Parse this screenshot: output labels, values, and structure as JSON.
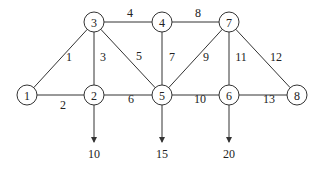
{
  "diagram": {
    "type": "network-graph",
    "nodes": [
      {
        "id": "1",
        "label": "1",
        "x": 27,
        "y": 95
      },
      {
        "id": "2",
        "label": "2",
        "x": 94,
        "y": 95
      },
      {
        "id": "3",
        "label": "3",
        "x": 94,
        "y": 22
      },
      {
        "id": "4",
        "label": "4",
        "x": 162,
        "y": 22
      },
      {
        "id": "5",
        "label": "5",
        "x": 162,
        "y": 95
      },
      {
        "id": "6",
        "label": "6",
        "x": 229,
        "y": 95
      },
      {
        "id": "7",
        "label": "7",
        "x": 229,
        "y": 22
      },
      {
        "id": "8",
        "label": "8",
        "x": 297,
        "y": 95
      }
    ],
    "edges": [
      {
        "from": "1",
        "to": "3",
        "label": "1",
        "lx": 69,
        "ly": 57
      },
      {
        "from": "1",
        "to": "2",
        "label": "2",
        "lx": 63,
        "ly": 105
      },
      {
        "from": "2",
        "to": "3",
        "label": "3",
        "lx": 103,
        "ly": 57
      },
      {
        "from": "3",
        "to": "4",
        "label": "4",
        "lx": 130,
        "ly": 13
      },
      {
        "from": "3",
        "to": "5",
        "label": "5",
        "lx": 139,
        "ly": 56
      },
      {
        "from": "2",
        "to": "5",
        "label": "6",
        "lx": 131,
        "ly": 99
      },
      {
        "from": "4",
        "to": "5",
        "label": "7",
        "lx": 172,
        "ly": 57
      },
      {
        "from": "4",
        "to": "7",
        "label": "8",
        "lx": 198,
        "ly": 13
      },
      {
        "from": "5",
        "to": "7",
        "label": "9",
        "lx": 206,
        "ly": 57
      },
      {
        "from": "5",
        "to": "6",
        "label": "10",
        "lx": 200,
        "ly": 99
      },
      {
        "from": "6",
        "to": "7",
        "label": "11",
        "lx": 241,
        "ly": 57
      },
      {
        "from": "7",
        "to": "8",
        "label": "12",
        "lx": 276,
        "ly": 57
      },
      {
        "from": "6",
        "to": "8",
        "label": "13",
        "lx": 269,
        "ly": 99
      }
    ],
    "demands": [
      {
        "node": "2",
        "value": "10",
        "x": 94,
        "arrow_end_y": 142,
        "label_y": 154
      },
      {
        "node": "5",
        "value": "15",
        "x": 162,
        "arrow_end_y": 142,
        "label_y": 154
      },
      {
        "node": "6",
        "value": "20",
        "x": 229,
        "arrow_end_y": 142,
        "label_y": 154
      }
    ],
    "node_radius": 10,
    "colors": {
      "stroke": "#333333",
      "text": "#222222",
      "background": "#ffffff"
    }
  }
}
